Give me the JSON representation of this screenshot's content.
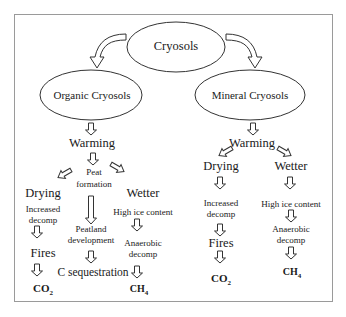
{
  "diagram": {
    "root": "Cryosols",
    "left_branch": {
      "title": "Organic Cryosols",
      "warming": "Warming",
      "peat_line1": "Peat",
      "peat_line2": "formation",
      "drying": "Drying",
      "wetter": "Wetter",
      "increased_line1": "Increased",
      "increased_line2": "decomp",
      "high_ice": "High ice content",
      "peatland_line1": "Peatland",
      "peatland_line2": "development",
      "fires": "Fires",
      "anaerobic_line1": "Anaerobic",
      "anaerobic_line2": "decomp",
      "c_sequestration": "C sequestration",
      "co2": "CO",
      "co2_sub": "2",
      "ch4": "CH",
      "ch4_sub": "4"
    },
    "right_branch": {
      "title": "Mineral Cryosols",
      "warming": "Warming",
      "drying": "Drying",
      "wetter": "Wetter",
      "increased_line1": "Increased",
      "increased_line2": "decomp",
      "high_ice": "High ice content",
      "fires": "Fires",
      "anaerobic_line1": "Anaerobic",
      "anaerobic_line2": "decomp",
      "co2": "CO",
      "co2_sub": "2",
      "ch4": "CH",
      "ch4_sub": "4"
    }
  }
}
